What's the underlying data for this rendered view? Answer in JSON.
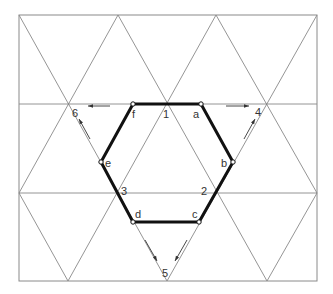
{
  "colors": {
    "grid": "#7a7a7a",
    "hexagon": "#111111",
    "labels": "#333333",
    "background": "#ffffff"
  },
  "frame": {
    "x1": 19,
    "y1": 15,
    "x2": 317,
    "y2": 281
  },
  "grid_lines": [
    {
      "id": "h1",
      "x1": 19,
      "y1": 104,
      "x2": 317,
      "y2": 104
    },
    {
      "id": "h2",
      "x1": 19,
      "y1": 193,
      "x2": 317,
      "y2": 193
    },
    {
      "id": "dr1",
      "x1": 19,
      "y1": 15,
      "x2": 167,
      "y2": 281
    },
    {
      "id": "dr2",
      "x1": 118,
      "y1": 15,
      "x2": 267,
      "y2": 281
    },
    {
      "id": "dr3",
      "x1": 216,
      "y1": 15,
      "x2": 317,
      "y2": 193
    },
    {
      "id": "dr4",
      "x1": 19,
      "y1": 193,
      "x2": 68,
      "y2": 281
    },
    {
      "id": "ur1",
      "x1": 68,
      "y1": 281,
      "x2": 216,
      "y2": 15
    },
    {
      "id": "ur2",
      "x1": 167,
      "y1": 281,
      "x2": 317,
      "y2": 15
    },
    {
      "id": "ur3",
      "x1": 19,
      "y1": 193,
      "x2": 118,
      "y2": 15
    },
    {
      "id": "ur4",
      "x1": 267,
      "y1": 281,
      "x2": 317,
      "y2": 193
    }
  ],
  "hexagon": {
    "vertices": [
      {
        "name": "a",
        "x": 201,
        "y": 104
      },
      {
        "name": "b",
        "x": 233,
        "y": 162
      },
      {
        "name": "c",
        "x": 199,
        "y": 222
      },
      {
        "name": "d",
        "x": 133,
        "y": 222
      },
      {
        "name": "e",
        "x": 101,
        "y": 162
      },
      {
        "name": "f",
        "x": 133,
        "y": 104
      }
    ]
  },
  "labels": [
    {
      "text": "f",
      "x": 132,
      "y": 118
    },
    {
      "text": "1",
      "x": 163,
      "y": 118
    },
    {
      "text": "a",
      "x": 193,
      "y": 118
    },
    {
      "text": "6",
      "x": 72,
      "y": 117
    },
    {
      "text": "4",
      "x": 255,
      "y": 116
    },
    {
      "text": "e",
      "x": 105,
      "y": 167
    },
    {
      "text": "b",
      "x": 221,
      "y": 167
    },
    {
      "text": "3",
      "x": 121,
      "y": 195
    },
    {
      "text": "2",
      "x": 201,
      "y": 195
    },
    {
      "text": "d",
      "x": 135,
      "y": 218
    },
    {
      "text": "c",
      "x": 192,
      "y": 218
    },
    {
      "text": "5",
      "x": 162,
      "y": 277
    }
  ],
  "arrows": [
    {
      "id": "to-6",
      "x1": 110,
      "y1": 106,
      "x2": 88,
      "y2": 106
    },
    {
      "id": "to-4",
      "x1": 226,
      "y1": 106,
      "x2": 249,
      "y2": 106
    },
    {
      "id": "to-6-diag",
      "x1": 90,
      "y1": 139,
      "x2": 79,
      "y2": 119
    },
    {
      "id": "to-4-diag",
      "x1": 244,
      "y1": 139,
      "x2": 255,
      "y2": 119
    },
    {
      "id": "to-5-left",
      "x1": 145,
      "y1": 240,
      "x2": 157,
      "y2": 261
    },
    {
      "id": "to-5-right",
      "x1": 187,
      "y1": 240,
      "x2": 175,
      "y2": 261
    }
  ]
}
